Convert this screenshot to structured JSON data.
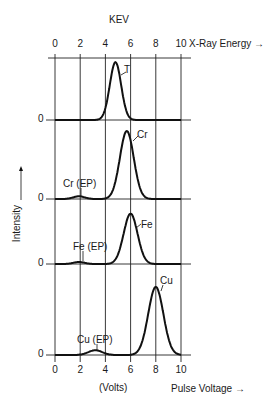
{
  "chart_data": {
    "type": "line",
    "title": "KEV",
    "top_axis": {
      "label": "X-Ray Energy →",
      "unit_label": "KEV",
      "ticks": [
        0,
        2,
        4,
        6,
        8,
        10
      ]
    },
    "bottom_axis": {
      "label": "Pulse Voltage →",
      "unit_label": "(Volts)",
      "ticks": [
        0,
        2,
        4,
        6,
        8,
        10
      ]
    },
    "ylabel": "Intensity",
    "xlim": [
      0,
      10
    ],
    "grid": true,
    "panels": [
      {
        "name": "T",
        "baseline_label": "0",
        "peaks": [
          {
            "label": "T",
            "center": 4.8,
            "height": 0.85,
            "width": 0.45
          }
        ]
      },
      {
        "name": "Cr",
        "baseline_label": "0",
        "peaks": [
          {
            "label": "Cr (EP)",
            "center": 1.9,
            "height": 0.04,
            "width": 0.45
          },
          {
            "label": "Cr",
            "center": 5.7,
            "height": 1.0,
            "width": 0.55
          }
        ]
      },
      {
        "name": "Fe",
        "baseline_label": "0",
        "peaks": [
          {
            "label": "Fe (EP)",
            "center": 1.9,
            "height": 0.03,
            "width": 0.45
          },
          {
            "label": "Fe",
            "center": 6.0,
            "height": 0.74,
            "width": 0.55
          }
        ]
      },
      {
        "name": "Cu",
        "baseline_label": "0",
        "peaks": [
          {
            "label": "Cu (EP)",
            "center": 3.2,
            "height": 0.07,
            "width": 0.55
          },
          {
            "label": "Cu",
            "center": 8.0,
            "height": 1.0,
            "width": 0.6
          }
        ]
      }
    ]
  },
  "labels": {
    "kev": "KEV",
    "xray": "X-Ray Energy →",
    "volts": "(Volts)",
    "pulse": "Pulse Voltage →",
    "intensity": "Intensity",
    "zero": "0",
    "T": "T",
    "Cr": "Cr",
    "CrEP": "Cr (EP)",
    "Fe": "Fe",
    "FeEP": "Fe (EP)",
    "Cu": "Cu",
    "CuEP": "Cu (EP)"
  },
  "ticks": [
    "0",
    "2",
    "4",
    "6",
    "8",
    "10"
  ]
}
